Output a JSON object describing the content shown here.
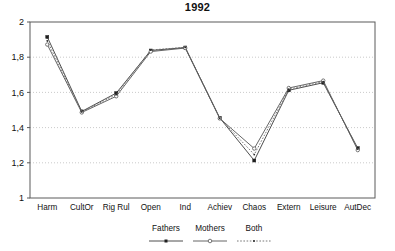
{
  "chart_data": {
    "type": "line",
    "title": "1992",
    "xlabel": "",
    "ylabel": "",
    "ylim": [
      1,
      2
    ],
    "yticks": [
      1,
      1.2,
      1.4,
      1.6,
      1.8,
      2
    ],
    "ytick_labels": [
      "1",
      "1,2",
      "1,4",
      "1,6",
      "1,8",
      "2"
    ],
    "grid": "horizontal-dotted",
    "legend_position": "bottom-center",
    "categories": [
      "Harm",
      "CultOr",
      "Rig Rul",
      "Open",
      "Ind",
      "Achiev",
      "Chaos",
      "Extern",
      "Leisure",
      "AutDec"
    ],
    "series": [
      {
        "name": "Fathers",
        "marker": "filled-square",
        "line": "solid",
        "color": "#3a3a3a",
        "values": [
          1.915,
          1.492,
          1.596,
          1.838,
          1.855,
          1.455,
          1.213,
          1.612,
          1.655,
          1.283
        ]
      },
      {
        "name": "Mothers",
        "marker": "open-circle",
        "line": "solid",
        "color": "#555555",
        "values": [
          1.872,
          1.486,
          1.578,
          1.832,
          1.852,
          1.452,
          1.281,
          1.625,
          1.667,
          1.272
        ]
      },
      {
        "name": "Both",
        "marker": "dot",
        "line": "dotted",
        "color": "#6a6a6a",
        "values": [
          1.893,
          1.489,
          1.588,
          1.841,
          1.856,
          1.453,
          1.247,
          1.618,
          1.661,
          1.278
        ]
      }
    ]
  },
  "legend": {
    "entries": [
      {
        "label": "Fathers"
      },
      {
        "label": "Mothers"
      },
      {
        "label": "Both"
      }
    ]
  },
  "axes": {
    "frame_color": "#5a5a5a",
    "grid_color": "#bdbdbd"
  }
}
